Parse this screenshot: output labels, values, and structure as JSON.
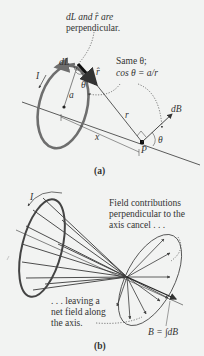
{
  "panel_a": {
    "label": "(a)",
    "annotation_perpendicular": [
      "dL and r̂ are",
      "perpendicular."
    ],
    "annotation_same_theta": [
      "Same θ;",
      "cos θ = a/r"
    ],
    "symbols": {
      "current": "I",
      "dL": "dL",
      "rhat": "r̂",
      "theta_loop": "θ",
      "radius": "a",
      "distance_r": "r",
      "distance_x": "x",
      "point": "P",
      "dB": "dB",
      "theta_P": "θ"
    }
  },
  "panel_b": {
    "label": "(b)",
    "annotation_cancel": [
      "Field contributions",
      "perpendicular to the",
      "axis cancel . . ."
    ],
    "annotation_net": [
      ". . . leaving a",
      "net field along",
      "the axis."
    ],
    "current": "I",
    "equation": "B = ∫dB"
  },
  "colors": {
    "loop": "#6e6e6e",
    "lines": "#3a3a3a",
    "background": "#f2f3f2"
  }
}
